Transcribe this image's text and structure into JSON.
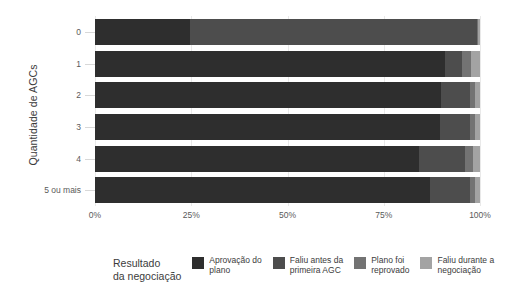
{
  "chart_data": {
    "type": "bar",
    "orientation": "horizontal",
    "stacked": true,
    "normalized": true,
    "title": "",
    "xlabel": "",
    "ylabel": "Quantidade de AGCs",
    "categories": [
      "0",
      "1",
      "2",
      "3",
      "4",
      "5 ou mais"
    ],
    "xlim": [
      0,
      100
    ],
    "xticks": [
      0,
      25,
      50,
      75,
      100
    ],
    "xtick_labels": [
      "0%",
      "25%",
      "50%",
      "75%",
      "100%"
    ],
    "grid": true,
    "legend_position": "bottom",
    "legend_title": "Resultado\nda negociação",
    "series": [
      {
        "name": "Aprovação do plano",
        "label": "Aprovação do\nplano",
        "color": "#2e2e2e",
        "values": [
          24.7,
          91.0,
          89.9,
          89.6,
          84.2,
          87.0
        ]
      },
      {
        "name": "Faliu antes da primeira AGC",
        "label": "Faliu antes da\nprimeira AGC",
        "color": "#4d4d4d",
        "values": [
          74.5,
          4.4,
          7.5,
          7.8,
          11.9,
          10.4
        ]
      },
      {
        "name": "Plano foi reprovado",
        "label": "Plano foi\nreprovado",
        "color": "#737373",
        "values": [
          0.4,
          2.2,
          1.3,
          1.3,
          2.0,
          1.3
        ]
      },
      {
        "name": "Faliu durante a negociação",
        "label": "Faliu durante a\nnegociação",
        "color": "#a3a3a3",
        "values": [
          0.4,
          2.4,
          1.3,
          1.3,
          1.9,
          1.3
        ]
      }
    ]
  },
  "axis": {
    "y_title": "Quantidade de AGCs"
  },
  "legend": {
    "title_line1": "Resultado",
    "title_line2": "da negociação"
  }
}
